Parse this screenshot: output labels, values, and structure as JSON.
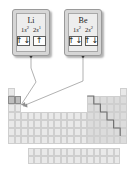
{
  "figure": {
    "type": "periodic-table-callout-diagram"
  },
  "callouts": [
    {
      "id": "li",
      "symbol": "Li",
      "subshells": [
        {
          "shell": "1",
          "orbital": "s",
          "superscript": "2"
        },
        {
          "shell": "2",
          "orbital": "s",
          "superscript": "1"
        }
      ],
      "orbital_boxes": [
        {
          "label": "1s",
          "arrows": [
            "up",
            "down"
          ]
        },
        {
          "label": "2s",
          "arrows": [
            "up"
          ]
        }
      ],
      "points_to": "period-2-group-1-cell"
    },
    {
      "id": "be",
      "symbol": "Be",
      "subshells": [
        {
          "shell": "1",
          "orbital": "s",
          "superscript": "2"
        },
        {
          "shell": "2",
          "orbital": "s",
          "superscript": "2"
        }
      ],
      "orbital_boxes": [
        {
          "label": "1s",
          "arrows": [
            "up",
            "down"
          ]
        },
        {
          "label": "2s",
          "arrows": [
            "up",
            "down"
          ]
        }
      ],
      "points_to": "period-2-group-2-cell"
    }
  ],
  "periodic_table": {
    "rows": 7,
    "groups": 18,
    "fblock_rows": 2,
    "fblock_columns": 14,
    "highlighted_cells": [
      "period-2-group-1-cell",
      "period-2-group-2-cell"
    ],
    "metalloid_staircase": true
  },
  "glyphs": {
    "arrow_up": "↑",
    "arrow_down": "↓"
  },
  "colors": {
    "callout_frame": "#d6d6d6",
    "callout_face": "#ededed",
    "cell_fill": "#e9e9e9",
    "cell_border": "#cfcfcf",
    "highlight_fill": "#bdbdbd",
    "staircase": "#6f6f6f",
    "leader_line": "#8f8f8f"
  }
}
